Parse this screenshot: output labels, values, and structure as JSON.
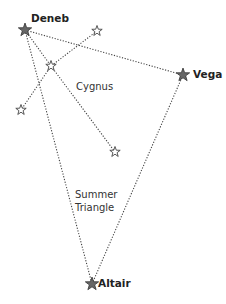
{
  "diagram": {
    "colors": {
      "background": "#ffffff",
      "line": "#444444",
      "bright_star_fill": "#666666",
      "bright_star_stroke": "#333333",
      "dim_star_fill": "#ffffff",
      "dim_star_stroke": "#444444"
    },
    "stars": [
      {
        "id": "deneb",
        "name": "Deneb",
        "x": 25,
        "y": 30,
        "bright": true
      },
      {
        "id": "vega",
        "name": "Vega",
        "x": 183,
        "y": 75,
        "bright": true
      },
      {
        "id": "altair",
        "name": "Altair",
        "x": 92,
        "y": 284,
        "bright": true
      },
      {
        "id": "cyg-wing-ne",
        "name": "",
        "x": 97,
        "y": 31,
        "bright": false
      },
      {
        "id": "cyg-center",
        "name": "",
        "x": 51,
        "y": 66,
        "bright": false
      },
      {
        "id": "cyg-wing-sw",
        "name": "",
        "x": 21,
        "y": 110,
        "bright": false
      },
      {
        "id": "cyg-tail",
        "name": "",
        "x": 115,
        "y": 152,
        "bright": false
      }
    ],
    "lines": [
      {
        "from": "deneb",
        "to": "vega"
      },
      {
        "from": "deneb",
        "to": "altair"
      },
      {
        "from": "vega",
        "to": "altair"
      },
      {
        "from": "deneb",
        "to": "cyg-center"
      },
      {
        "from": "cyg-center",
        "to": "cyg-tail"
      },
      {
        "from": "cyg-wing-ne",
        "to": "cyg-center"
      },
      {
        "from": "cyg-center",
        "to": "cyg-wing-sw"
      }
    ],
    "labels": {
      "deneb": "Deneb",
      "vega": "Vega",
      "altair": "Altair",
      "cygnus": "Cygnus",
      "summer_line1": "Summer",
      "summer_line2": "Triangle"
    }
  }
}
